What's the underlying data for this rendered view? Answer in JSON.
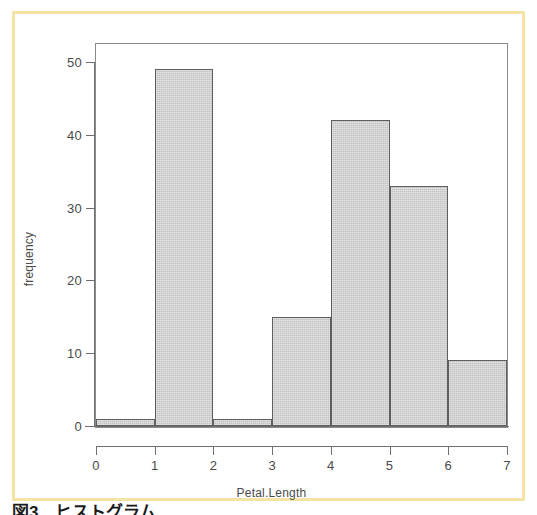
{
  "figure": {
    "frame_color": "#f3e4a6",
    "background_color": "#ffffff",
    "caption": "図3　ヒストグラム"
  },
  "chart_data": {
    "type": "bar",
    "title": "",
    "subtitle": "",
    "xlabel": "Petal.Length",
    "ylabel": "frequency",
    "categories": [
      "0-1",
      "1-2",
      "2-3",
      "3-4",
      "4-5",
      "5-6",
      "6-7"
    ],
    "bin_edges": [
      0,
      1,
      2,
      3,
      4,
      5,
      6,
      7
    ],
    "values": [
      1,
      49,
      1,
      15,
      42,
      33,
      9
    ],
    "xlim": [
      0,
      7
    ],
    "ylim": [
      0,
      50
    ],
    "xticks": [
      0,
      1,
      2,
      3,
      4,
      5,
      6,
      7
    ],
    "xtick_labels": [
      "0",
      "1",
      "2",
      "3",
      "4",
      "5",
      "6",
      "7"
    ],
    "yticks": [
      0,
      10,
      20,
      30,
      40,
      50
    ],
    "ytick_labels": [
      "0",
      "10",
      "20",
      "30",
      "40",
      "50"
    ],
    "grid": false,
    "legend": false,
    "legend_position": "none",
    "bar_fill_color": "#c9c9c9",
    "bar_border_color": "#5e5e5e",
    "axis_color": "#6f6f6f"
  }
}
